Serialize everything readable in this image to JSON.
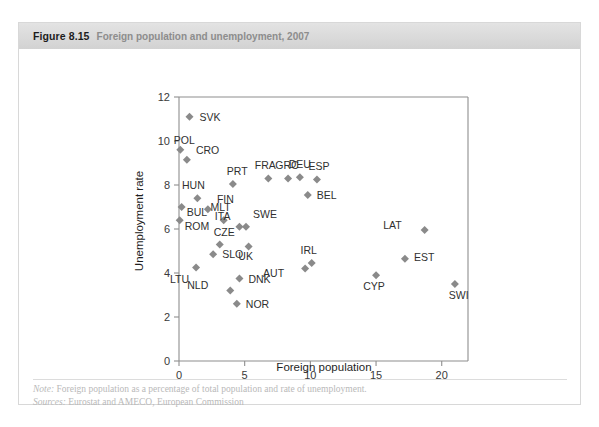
{
  "figure": {
    "number": "Figure 8.15",
    "title": "Foreign population and unemployment, 2007"
  },
  "footer": {
    "note_lead": "Note:",
    "note_text": " Foreign population as a percentage of total population and rate of unemployment.",
    "sources_lead": "Sources:",
    "sources_text": " Eurostat and AMECO, European Commission"
  },
  "colors": {
    "marker": "#8a8a8a",
    "axis": "#8e8e8e",
    "header_bar": "#dadada",
    "footer_text": "#b9b9b9"
  },
  "chart_data": {
    "type": "scatter",
    "title": "Foreign population and unemployment, 2007",
    "xlabel": "Foreign population",
    "ylabel": "Unemployment rate",
    "xlim": [
      0,
      22
    ],
    "ylim": [
      0,
      12
    ],
    "xticks": [
      0,
      5,
      10,
      15,
      20
    ],
    "yticks": [
      0,
      2,
      4,
      6,
      8,
      10,
      12
    ],
    "grid": false,
    "legend": "none",
    "marker_shape": "diamond",
    "points": [
      {
        "label": "SVK",
        "x": 0.8,
        "y": 11.1,
        "lx": 10,
        "ly": 4
      },
      {
        "label": "POL",
        "x": 0.1,
        "y": 9.6,
        "lx": 4,
        "ly": -6
      },
      {
        "label": "CRO",
        "x": 0.6,
        "y": 9.15,
        "lx": 9,
        "ly": -6
      },
      {
        "label": "PRT",
        "x": 4.1,
        "y": 8.05,
        "lx": -6,
        "ly": -9
      },
      {
        "label": "HUN",
        "x": 1.4,
        "y": 7.4,
        "lx": -4,
        "ly": -9
      },
      {
        "label": "FIN",
        "x": 2.2,
        "y": 6.9,
        "lx": 9,
        "ly": -6
      },
      {
        "label": "BUL",
        "x": 0.2,
        "y": 7.0,
        "lx": 5,
        "ly": 9
      },
      {
        "label": "ROM",
        "x": 0.05,
        "y": 6.4,
        "lx": 5,
        "ly": 10
      },
      {
        "label": "MLT",
        "x": 3.4,
        "y": 6.4,
        "lx": -3,
        "ly": -9
      },
      {
        "label": "CZE",
        "x": 3.1,
        "y": 5.3,
        "lx": -6,
        "ly": -8
      },
      {
        "label": "ITA",
        "x": 4.6,
        "y": 6.1,
        "lx": -9,
        "ly": -7
      },
      {
        "label": "SWE",
        "x": 5.1,
        "y": 6.1,
        "lx": 7,
        "ly": -9
      },
      {
        "label": "SLO",
        "x": 2.6,
        "y": 4.85,
        "lx": 9,
        "ly": 4
      },
      {
        "label": "UK",
        "x": 5.3,
        "y": 5.2,
        "lx": -3,
        "ly": 13
      },
      {
        "label": "LTU",
        "x": 1.3,
        "y": 4.25,
        "lx": -7,
        "ly": 15
      },
      {
        "label": "NLD",
        "x": 3.9,
        "y": 3.2,
        "lx": -22,
        "ly": -2
      },
      {
        "label": "DNK",
        "x": 4.6,
        "y": 3.75,
        "lx": 9,
        "ly": 4
      },
      {
        "label": "NOR",
        "x": 4.4,
        "y": 2.6,
        "lx": 9,
        "ly": 4
      },
      {
        "label": "FRA",
        "x": 6.8,
        "y": 8.3,
        "lx": -3,
        "ly": -9
      },
      {
        "label": "GRC",
        "x": 8.3,
        "y": 8.3,
        "lx": -1,
        "ly": -9
      },
      {
        "label": "DEU",
        "x": 9.2,
        "y": 8.35,
        "lx": 0,
        "ly": -9
      },
      {
        "label": "ESP",
        "x": 10.5,
        "y": 8.25,
        "lx": 2,
        "ly": -10
      },
      {
        "label": "BEL",
        "x": 9.8,
        "y": 7.55,
        "lx": 9,
        "ly": 4
      },
      {
        "label": "IRL",
        "x": 10.1,
        "y": 4.45,
        "lx": -3,
        "ly": -9
      },
      {
        "label": "AUT",
        "x": 9.6,
        "y": 4.2,
        "lx": -21,
        "ly": 8
      },
      {
        "label": "CYP",
        "x": 15.0,
        "y": 3.9,
        "lx": -2,
        "ly": 15
      },
      {
        "label": "LAT",
        "x": 18.7,
        "y": 5.95,
        "lx": -23,
        "ly": -1
      },
      {
        "label": "EST",
        "x": 17.2,
        "y": 4.65,
        "lx": 9,
        "ly": 2
      },
      {
        "label": "SWI",
        "x": 21.0,
        "y": 3.5,
        "lx": -6,
        "ly": 15
      }
    ]
  }
}
